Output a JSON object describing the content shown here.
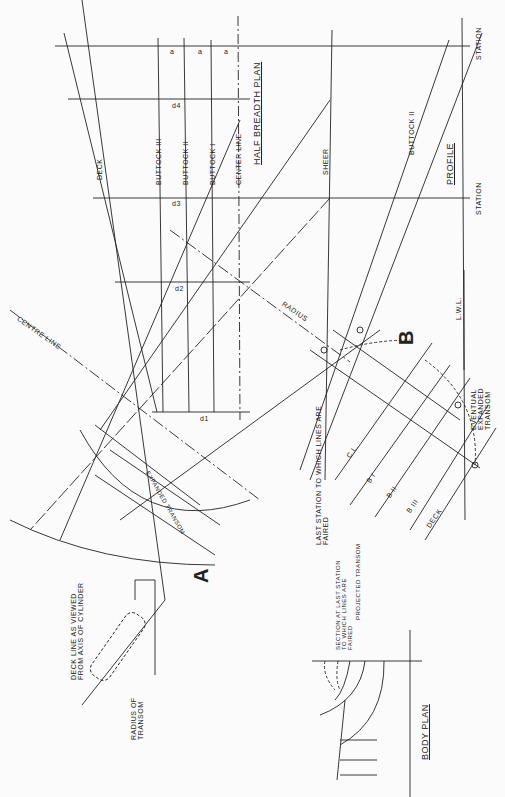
{
  "views": {
    "half_breadth_plan": {
      "label": "HALF BREADTH PLAN"
    },
    "profile": {
      "label": "PROFILE"
    },
    "body_plan": {
      "label": "BODY PLAN"
    }
  },
  "labels": {
    "deck": "DECK",
    "buttock_3": "BUTTOCK III",
    "buttock_2": "BUTTOCK II",
    "buttock_1": "BUTTOCK I",
    "center_line": "CENTER LINE",
    "sheer": "SHEER",
    "buttock_2_profile": "BUTTOCK II",
    "station_top": "STATION",
    "station_mid": "STATION",
    "lwl": "L.W.L.",
    "radius": "RADIUS",
    "centre_line": "CENTRE LINE",
    "expanded_transom": "EXPANDED TRANSOM",
    "point_a": "A",
    "point_b": "B",
    "last_station": "LAST STATION TO WHICH LINES ARE FAIRED",
    "eventual_transom": "EVENTUAL EXPANDED TRANSOM",
    "deck_line_cylinder": "DECK LINE AS VIEWED FROM AXIS OF CYLINDER",
    "radius_of_transom": "RADIUS OF TRANSOM",
    "section_last_station": "SECTION AT LAST STATION TO WHICH LINES ARE FAIRED",
    "projected_transom": "PROJECTED TRANSOM",
    "cl": "C.L.",
    "b1": "B I",
    "b2": "B II",
    "b3": "B III",
    "deck_small": "DECK"
  },
  "dimensions": {
    "a": "a",
    "b": "b",
    "d1": "d1",
    "d2": "d2",
    "d3": "d3",
    "d4": "d4"
  }
}
